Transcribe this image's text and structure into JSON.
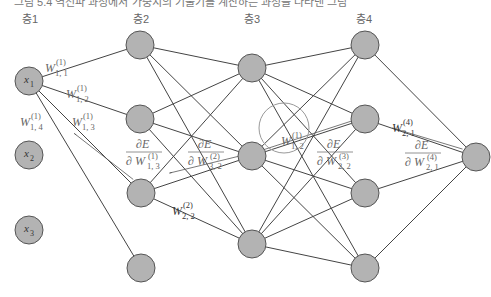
{
  "header": {
    "cut_text": "그림 5.4  역전파 과정에서 가중치의 기울기를 계산하는 과정을 나타낸 그림"
  },
  "layers": [
    {
      "label": "층1",
      "x": 22
    },
    {
      "label": "층2",
      "x": 133
    },
    {
      "label": "층3",
      "x": 244
    },
    {
      "label": "층4",
      "x": 356
    }
  ],
  "nodes": {
    "input": [
      {
        "id": "x1",
        "label": "x",
        "sub": "1",
        "cx": 29,
        "cy": 81
      },
      {
        "id": "x2",
        "label": "x",
        "sub": "2",
        "cx": 29,
        "cy": 155
      },
      {
        "id": "x3",
        "label": "x",
        "sub": "3",
        "cx": 29,
        "cy": 230
      }
    ],
    "layer2": [
      {
        "cx": 140,
        "cy": 45
      },
      {
        "cx": 140,
        "cy": 119
      },
      {
        "cx": 141,
        "cy": 193
      },
      {
        "cx": 141,
        "cy": 268
      }
    ],
    "layer3": [
      {
        "cx": 252,
        "cy": 68
      },
      {
        "cx": 252,
        "cy": 156
      },
      {
        "cx": 252,
        "cy": 244
      }
    ],
    "layer4": [
      {
        "cx": 365,
        "cy": 45
      },
      {
        "cx": 365,
        "cy": 119
      },
      {
        "cx": 365,
        "cy": 193
      },
      {
        "cx": 365,
        "cy": 268
      }
    ],
    "output": [
      {
        "cx": 476,
        "cy": 157
      }
    ]
  },
  "weights": [
    {
      "text": "W",
      "sup": "(1)",
      "sub": "1, 1",
      "x": 45,
      "y": 62
    },
    {
      "text": "W",
      "sup": "(1)",
      "sub": "1, 2",
      "x": 66,
      "y": 88
    },
    {
      "text": "W",
      "sup": "(1)",
      "sub": "1, 3",
      "x": 72,
      "y": 116
    },
    {
      "text": "W",
      "sup": "(1)",
      "sub": "1, 4",
      "x": 20,
      "y": 116
    },
    {
      "text": "W",
      "sup": "(2)",
      "sub": "2, 2",
      "x": 172,
      "y": 205
    },
    {
      "text": "W",
      "sup": "(1)",
      "sub": "1, 2",
      "x": 281,
      "y": 135
    },
    {
      "text": "W",
      "sup": "(4)",
      "sub": "2, 1",
      "x": 392,
      "y": 122
    }
  ],
  "gradients": [
    {
      "num": "∂E",
      "den": "∂ W",
      "sup": "(1)",
      "sub": "1, 3",
      "x": 128,
      "y": 152
    },
    {
      "num": "∂E",
      "den": "∂ W",
      "sup": "(2)",
      "sub": "3, 2",
      "x": 190,
      "y": 152
    },
    {
      "num": "∂E",
      "den": "∂ W",
      "sup": "(3)",
      "sub": "2, 2",
      "x": 319,
      "y": 152
    },
    {
      "num": "∂E",
      "den": "∂ W",
      "sup": "(4)",
      "sub": "2, 1",
      "x": 407,
      "y": 153
    }
  ],
  "colors": {
    "node_fill": "#b3b3b3",
    "node_stroke": "#555555",
    "edge": "#444444",
    "highlight_circle": "#999999"
  }
}
